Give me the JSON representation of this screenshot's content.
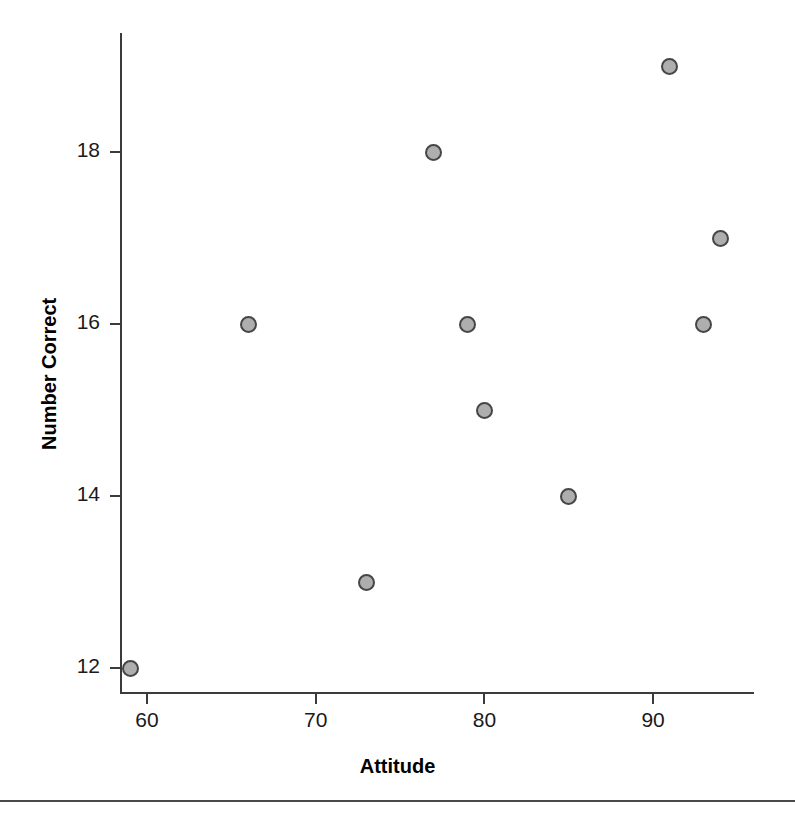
{
  "chart_data": {
    "type": "scatter",
    "title": "",
    "xlabel": "Attitude",
    "ylabel": "Number Correct",
    "xlim": [
      56,
      97
    ],
    "ylim": [
      11.3,
      19.7
    ],
    "xticks": [
      60,
      70,
      80,
      90
    ],
    "xtick_labels": [
      "60",
      "70",
      "80",
      "90"
    ],
    "yticks": [
      12,
      14,
      16,
      18
    ],
    "ytick_labels": [
      "12",
      "14",
      "16",
      "18"
    ],
    "grid": false,
    "legend": null,
    "marker": {
      "shape": "circle",
      "fill_color": "#aeaeae",
      "edge_color": "#464646",
      "size_px": 17
    },
    "x": [
      59,
      66,
      73,
      77,
      79,
      80,
      85,
      91,
      93,
      94
    ],
    "y": [
      12,
      16,
      13,
      18,
      16,
      15,
      14,
      19,
      16,
      17
    ],
    "points": [
      {
        "x": 59,
        "y": 12
      },
      {
        "x": 66,
        "y": 16
      },
      {
        "x": 73,
        "y": 13
      },
      {
        "x": 77,
        "y": 18
      },
      {
        "x": 79,
        "y": 16
      },
      {
        "x": 80,
        "y": 15
      },
      {
        "x": 85,
        "y": 14
      },
      {
        "x": 91,
        "y": 19
      },
      {
        "x": 93,
        "y": 16
      },
      {
        "x": 94,
        "y": 17
      }
    ]
  },
  "axes": {
    "x_title": "Attitude",
    "y_title": "Number Correct"
  },
  "colors": {
    "axis": "#3b3b3b",
    "text": "#1a1a1a",
    "marker_fill": "#aeaeae",
    "marker_edge": "#464646",
    "rule": "#4a4a4a",
    "background": "#ffffff"
  }
}
